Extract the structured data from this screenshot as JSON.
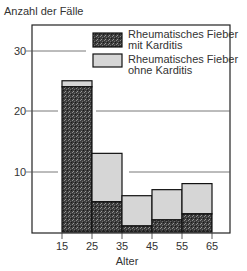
{
  "chart_data": {
    "type": "bar",
    "stacked": true,
    "histogram": true,
    "title": "",
    "ylabel": "Anzahl der Fälle",
    "xlabel": "Alter",
    "ylim": [
      0,
      34
    ],
    "yticks": [
      10,
      20,
      30
    ],
    "xticks": [
      15,
      25,
      35,
      45,
      55,
      65
    ],
    "categories": [
      "15-25",
      "25-35",
      "35-45",
      "45-55",
      "55-65"
    ],
    "bins": [
      [
        15,
        25
      ],
      [
        25,
        35
      ],
      [
        35,
        45
      ],
      [
        45,
        55
      ],
      [
        55,
        65
      ]
    ],
    "series": [
      {
        "name": "Rheumatisches Fieber mit Karditis",
        "color": "#3a3a3a",
        "values": [
          24,
          5,
          1,
          2,
          3
        ]
      },
      {
        "name": "Rheumatisches Fieber ohne Karditis",
        "color": "#d6d6d6",
        "values": [
          1,
          8,
          5,
          5,
          5
        ]
      }
    ],
    "totals": [
      25,
      13,
      6,
      7,
      8
    ],
    "grid": "partial horizontal lines at y ticks",
    "legend_position": "upper right inside"
  },
  "legend": {
    "item1_line1": "Rheumatisches Fieber",
    "item1_line2": "mit Karditis",
    "item2_line1": "Rheumatisches Fieber",
    "item2_line2": "ohne Karditis"
  },
  "axes": {
    "ylabel": "Anzahl der Fälle",
    "xlabel": "Alter",
    "yticks": [
      "10",
      "20",
      "30"
    ],
    "xticks": [
      "15",
      "25",
      "35",
      "45",
      "55",
      "65"
    ]
  }
}
